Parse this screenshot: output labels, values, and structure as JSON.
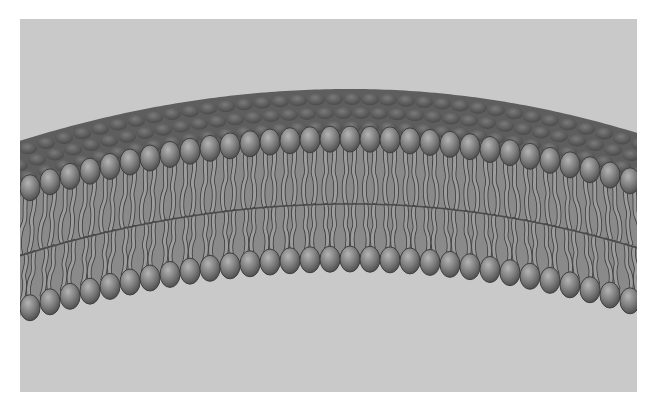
{
  "image": {
    "subject": "phospholipid-bilayer-illustration",
    "width": 655,
    "height": 411,
    "panel": {
      "x": 20,
      "y": 19,
      "width": 617,
      "height": 373
    }
  },
  "colors": {
    "page_background": "#ffffff",
    "panel_background": "#c9c9c9",
    "head_fill": "#7e7e7e",
    "head_highlight": "#b4b4b4",
    "head_shadow": "#4e4e4e",
    "back_surface": "#5e5e5e",
    "tail_fill": "#9c9c9c",
    "tail_outline": "#3c3c3c"
  },
  "membrane": {
    "arc": {
      "x0": -10,
      "x1": 630,
      "peak_x": 330,
      "left_drop": 55,
      "right_drop": 48
    },
    "back_surface_top_y": 70,
    "top_heads_y": 120,
    "mid_line_y": 185,
    "bottom_heads_y": 240,
    "head_spacing": 20,
    "head_rx": 10,
    "head_ry": 13,
    "tail_count_per_head": 2
  }
}
